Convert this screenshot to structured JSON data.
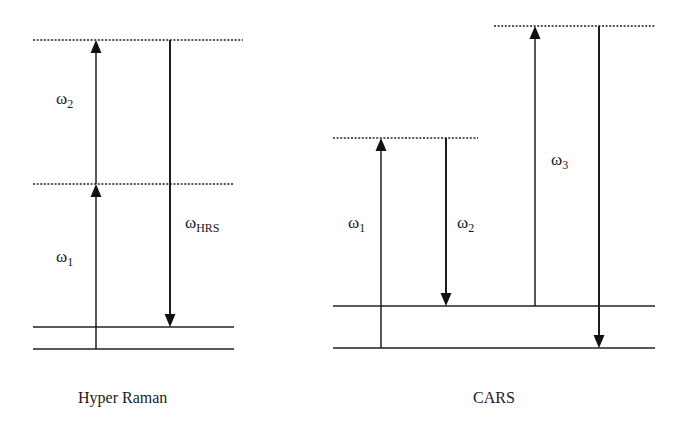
{
  "diagrams": [
    {
      "id": "hyper-raman",
      "caption": "Hyper Raman",
      "labels": [
        {
          "symbol": "ω",
          "sub": "2",
          "x": 56,
          "y": 104
        },
        {
          "symbol": "ω",
          "sub": "1",
          "x": 56,
          "y": 262
        },
        {
          "symbol": "ω",
          "sub": "HRS",
          "x": 185,
          "y": 228
        }
      ],
      "levels": [
        {
          "type": "virtual",
          "y": 40,
          "x1": 33,
          "x2": 243
        },
        {
          "type": "virtual",
          "y": 184,
          "x1": 33,
          "x2": 234
        },
        {
          "type": "real",
          "y": 327,
          "x1": 33,
          "x2": 234
        },
        {
          "type": "real",
          "y": 349,
          "x1": 33,
          "x2": 234
        }
      ],
      "arrows": [
        {
          "name": "omega1-up",
          "x": 96,
          "y1": 349,
          "y2": 184,
          "dir": "up"
        },
        {
          "name": "omega2-up",
          "x": 96,
          "y1": 184,
          "y2": 40,
          "dir": "up"
        },
        {
          "name": "omegaHRS-down",
          "x": 170,
          "y1": 40,
          "y2": 327,
          "dir": "down"
        }
      ]
    },
    {
      "id": "cars",
      "caption": "CARS",
      "labels": [
        {
          "symbol": "ω",
          "sub": "1",
          "x": 348,
          "y": 228
        },
        {
          "symbol": "ω",
          "sub": "2",
          "x": 457,
          "y": 228
        },
        {
          "symbol": "ω",
          "sub": "3",
          "x": 551,
          "y": 165
        }
      ],
      "levels": [
        {
          "type": "virtual",
          "y": 26,
          "x1": 494,
          "x2": 655
        },
        {
          "type": "virtual",
          "y": 138,
          "x1": 333,
          "x2": 478
        },
        {
          "type": "real",
          "y": 306,
          "x1": 333,
          "x2": 655
        },
        {
          "type": "real",
          "y": 348,
          "x1": 333,
          "x2": 655
        }
      ],
      "arrows": [
        {
          "name": "omega1-up",
          "x": 381,
          "y1": 348,
          "y2": 138,
          "dir": "up"
        },
        {
          "name": "omega2-down",
          "x": 446,
          "y1": 138,
          "y2": 306,
          "dir": "down"
        },
        {
          "name": "omega3-up",
          "x": 535,
          "y1": 306,
          "y2": 26,
          "dir": "up"
        },
        {
          "name": "omegaAS-down",
          "x": 599,
          "y1": 26,
          "y2": 348,
          "dir": "down"
        }
      ]
    }
  ],
  "captions": {
    "hyper_raman": "Hyper Raman",
    "cars": "CARS"
  }
}
